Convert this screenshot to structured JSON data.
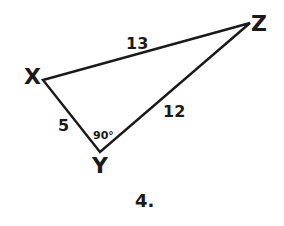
{
  "diagram": {
    "type": "right-triangle",
    "vertices": [
      {
        "name": "X",
        "x": 43,
        "y": 80
      },
      {
        "name": "Y",
        "x": 100,
        "y": 152
      },
      {
        "name": "Z",
        "x": 250,
        "y": 23
      }
    ],
    "sides": [
      {
        "between": "XZ",
        "length": "13"
      },
      {
        "between": "XY",
        "length": "5"
      },
      {
        "between": "YZ",
        "length": "12"
      }
    ],
    "angle": {
      "at": "Y",
      "label": "90°"
    },
    "problem_number": "4.",
    "stroke_color": "#1a1a1a",
    "background": "#ffffff"
  }
}
